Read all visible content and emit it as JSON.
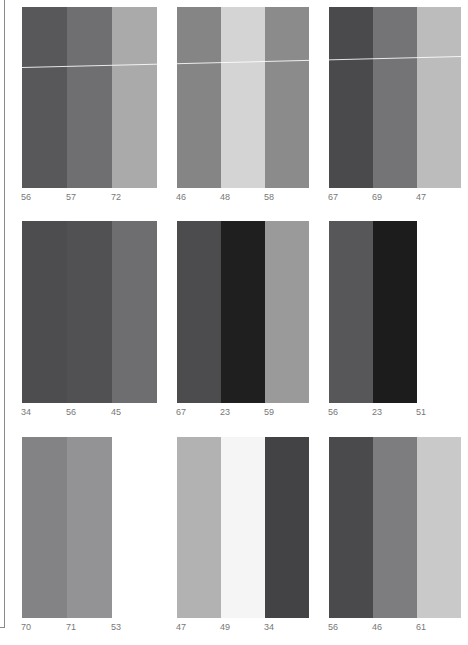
{
  "panels": [
    {
      "row": 0,
      "col": 0,
      "x": 22,
      "y": 7,
      "stripe_width": 45,
      "height": 181,
      "colors": [
        "#58585a",
        "#6f6f71",
        "#aaaaaa"
      ],
      "labels": [
        "56",
        "57",
        "72"
      ]
    },
    {
      "row": 0,
      "col": 1,
      "x": 177,
      "y": 7,
      "stripe_width": 44,
      "height": 181,
      "colors": [
        "#858585",
        "#d4d4d4",
        "#8b8b8b"
      ],
      "labels": [
        "46",
        "48",
        "58"
      ]
    },
    {
      "row": 0,
      "col": 2,
      "x": 329,
      "y": 7,
      "stripe_width": 44,
      "height": 181,
      "colors": [
        "#4a4a4c",
        "#747476",
        "#bcbcbc"
      ],
      "labels": [
        "67",
        "69",
        "47"
      ]
    },
    {
      "row": 1,
      "col": 0,
      "x": 22,
      "y": 221,
      "stripe_width": 45,
      "height": 182,
      "colors": [
        "#4d4d4f",
        "#515153",
        "#6e6e70"
      ],
      "labels": [
        "34",
        "56",
        "45"
      ]
    },
    {
      "row": 1,
      "col": 1,
      "x": 177,
      "y": 221,
      "stripe_width": 44,
      "height": 182,
      "colors": [
        "#4c4c4e",
        "#1f1f1f",
        "#9a9a9a"
      ],
      "labels": [
        "67",
        "23",
        "59"
      ]
    },
    {
      "row": 1,
      "col": 2,
      "x": 329,
      "y": 221,
      "stripe_width": 44,
      "height": 182,
      "colors": [
        "#575759",
        "#1c1c1c"
      ],
      "labels": [
        "56",
        "23",
        "51"
      ]
    },
    {
      "row": 2,
      "col": 0,
      "x": 22,
      "y": 437,
      "stripe_width": 45,
      "height": 181,
      "colors": [
        "#838385",
        "#939395"
      ],
      "labels": [
        "70",
        "71",
        "53"
      ]
    },
    {
      "row": 2,
      "col": 1,
      "x": 177,
      "y": 437,
      "stripe_width": 44,
      "height": 181,
      "colors": [
        "#b2b2b2",
        "#f5f5f5",
        "#434345"
      ],
      "labels": [
        "47",
        "49",
        "34"
      ]
    },
    {
      "row": 2,
      "col": 2,
      "x": 329,
      "y": 437,
      "stripe_width": 44,
      "height": 181,
      "colors": [
        "#4a4a4c",
        "#7d7d7f",
        "#c9c9c9"
      ],
      "labels": [
        "56",
        "46",
        "61"
      ]
    }
  ],
  "scanline": {
    "x1": 22,
    "y1": 67,
    "x2": 462,
    "y2": 56
  }
}
